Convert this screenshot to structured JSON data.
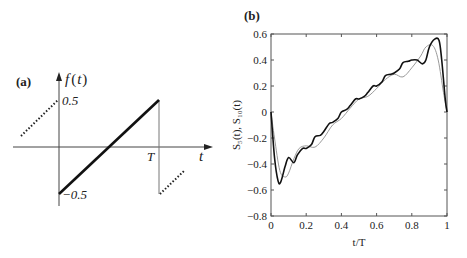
{
  "chart_data": [
    {
      "panel": "(a)",
      "type": "line",
      "title": "",
      "ylabel": "f(t)",
      "xlabel": "t",
      "tick_labels": {
        "y_top": "0.5",
        "y_bottom": "−0.5",
        "x_period": "T"
      },
      "description": "Sawtooth wave: linear ramp from -0.5 at t=0 to 0.5 at t=T, with dotted extensions of adjacent periods",
      "series": [
        {
          "name": "f(t) solid",
          "style": "solid",
          "x": [
            0,
            1
          ],
          "y": [
            -0.5,
            0.5
          ]
        },
        {
          "name": "previous period",
          "style": "dotted",
          "x": [
            -0.45,
            0
          ],
          "y": [
            0.05,
            0.5
          ]
        },
        {
          "name": "next period",
          "style": "dotted",
          "x": [
            1,
            1.3
          ],
          "y": [
            -0.5,
            -0.2
          ]
        }
      ]
    },
    {
      "panel": "(b)",
      "type": "line",
      "title": "",
      "xlabel": "t/T",
      "ylabel": "S5(t), S10(t)",
      "xlim": [
        0,
        1
      ],
      "ylim": [
        -0.8,
        0.6
      ],
      "xticks": [
        "0",
        "0.2",
        "0.4",
        "0.6",
        "0.8",
        "1"
      ],
      "yticks": [
        "0.6",
        "0.4",
        "0.2",
        "0",
        "−0.2",
        "−0.4",
        "−0.6",
        "−0.8"
      ],
      "grid": false,
      "legend": null,
      "series": [
        {
          "name": "S10(t)",
          "color": "#111111",
          "width": 1.6,
          "x": [
            0,
            0.02,
            0.04,
            0.055,
            0.08,
            0.1,
            0.13,
            0.15,
            0.18,
            0.2,
            0.23,
            0.25,
            0.28,
            0.3,
            0.33,
            0.35,
            0.38,
            0.4,
            0.43,
            0.45,
            0.48,
            0.5,
            0.53,
            0.55,
            0.58,
            0.6,
            0.63,
            0.65,
            0.68,
            0.7,
            0.73,
            0.75,
            0.78,
            0.8,
            0.83,
            0.86,
            0.88,
            0.9,
            0.93,
            0.955,
            0.97,
            0.99,
            1
          ],
          "y": [
            0,
            -0.35,
            -0.53,
            -0.54,
            -0.42,
            -0.35,
            -0.39,
            -0.33,
            -0.28,
            -0.28,
            -0.25,
            -0.19,
            -0.18,
            -0.15,
            -0.09,
            -0.08,
            -0.05,
            0.0,
            0.02,
            0.05,
            0.1,
            0.1,
            0.12,
            0.15,
            0.2,
            0.2,
            0.23,
            0.28,
            0.29,
            0.3,
            0.33,
            0.38,
            0.39,
            0.4,
            0.4,
            0.37,
            0.4,
            0.5,
            0.56,
            0.55,
            0.4,
            0.1,
            0
          ]
        },
        {
          "name": "S5(t)",
          "color": "#9a9a9a",
          "width": 1.0,
          "x": [
            0,
            0.02,
            0.05,
            0.08,
            0.1,
            0.13,
            0.16,
            0.2,
            0.25,
            0.3,
            0.35,
            0.4,
            0.45,
            0.5,
            0.55,
            0.6,
            0.65,
            0.7,
            0.75,
            0.8,
            0.85,
            0.88,
            0.92,
            0.95,
            0.98,
            1
          ],
          "y": [
            0,
            -0.2,
            -0.45,
            -0.5,
            -0.47,
            -0.36,
            -0.28,
            -0.26,
            -0.27,
            -0.2,
            -0.1,
            -0.05,
            0.03,
            0.1,
            0.12,
            0.18,
            0.25,
            0.29,
            0.27,
            0.34,
            0.43,
            0.5,
            0.51,
            0.4,
            0.15,
            0
          ]
        }
      ]
    }
  ],
  "panel_a": {
    "label": "(a)",
    "ylabel_f": "f",
    "ylabel_open": "(",
    "ylabel_t": "t",
    "ylabel_close": ")",
    "xlabel": "t",
    "tick_top": "0.5",
    "tick_bottom": "−0.5",
    "tick_T": "T"
  },
  "panel_b": {
    "label": "(b)",
    "xlabel": "t/T",
    "ylabel": "S₅(t), S₁₀(t)",
    "xticks": [
      "0",
      "0.2",
      "0.4",
      "0.6",
      "0.8",
      "1"
    ],
    "yticks": [
      "0.6",
      "0.4",
      "0.2",
      "0",
      "−0.2",
      "−0.4",
      "−0.6",
      "−0.8"
    ]
  }
}
